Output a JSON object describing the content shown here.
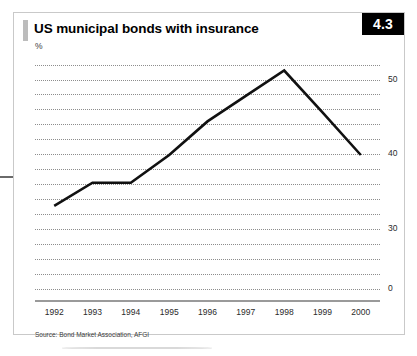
{
  "figure": {
    "number": "4.3",
    "title": "US municipal bonds with insurance",
    "unit_label": "%",
    "source": "Source: Bond Market Association, AFGI"
  },
  "chart_data": {
    "type": "line",
    "title": "US municipal bonds with insurance",
    "xlabel": "",
    "ylabel": "%",
    "categories": [
      "1992",
      "1993",
      "1994",
      "1995",
      "1996",
      "1997",
      "1998",
      "1999",
      "2000"
    ],
    "values": [
      33.1,
      36.2,
      36.2,
      39.9,
      44.4,
      47.8,
      51.2,
      45.6,
      39.9
    ],
    "series": [
      {
        "name": "US municipal bonds with insurance",
        "values": [
          33.1,
          36.2,
          36.2,
          39.9,
          44.4,
          47.8,
          51.2,
          45.6,
          39.9
        ],
        "color": "#111111"
      }
    ],
    "ylim": [
      22,
      53
    ],
    "ytick_labels": [
      "50",
      "40",
      "30",
      "0"
    ],
    "ytick_values": [
      50,
      40,
      30,
      22
    ],
    "ytick_position": "right",
    "gridlines": {
      "axis": "y",
      "style": "dotted",
      "count": 15,
      "values": [
        52,
        50,
        48,
        46,
        44,
        42,
        40,
        38,
        36,
        34,
        32,
        30,
        28,
        26,
        24,
        22
      ]
    },
    "legend": "none",
    "annotations": []
  }
}
